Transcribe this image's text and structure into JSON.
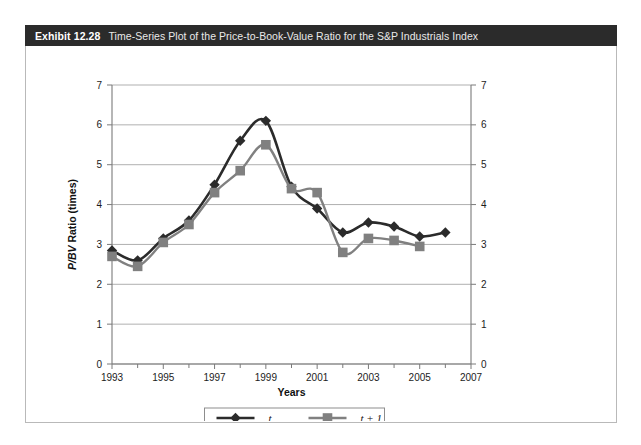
{
  "exhibit": {
    "number": "Exhibit 12.28",
    "title": "Time-Series Plot of the Price-to-Book-Value Ratio for the S&P Industrials Index"
  },
  "colors": {
    "header_bg": "#2b2b2b",
    "series_t": "#2b2b2b",
    "series_t1": "#808080",
    "grid": "#8c8c8c",
    "axis": "#7a7a7a",
    "panel_border": "#b9b9b9"
  },
  "chart_data": {
    "type": "line",
    "title": "Time-Series Plot of the Price-to-Book-Value Ratio for the S&P Industrials Index",
    "xlabel": "Years",
    "ylabel": "P/BV Ratio (times)",
    "ylabel_italic_part": "P/BV",
    "ylabel_plain_part": " Ratio (times)",
    "xlim": [
      1993,
      2007
    ],
    "ylim": [
      0,
      7
    ],
    "yticks": [
      0,
      1,
      2,
      3,
      4,
      5,
      6,
      7
    ],
    "ytick_labels": [
      "0",
      "1",
      "2",
      "3",
      "4",
      "5",
      "6",
      "7"
    ],
    "xticks": [
      1993,
      1995,
      1997,
      1999,
      2001,
      2003,
      2005,
      2007
    ],
    "xtick_labels": [
      "1993",
      "1995",
      "1997",
      "1999",
      "2001",
      "2003",
      "2005",
      "2007"
    ],
    "x_minor_ticks": [
      1994,
      1996,
      1998,
      2000,
      2002,
      2004,
      2006
    ],
    "grid": true,
    "grid_axis": "y",
    "dual_y_axis": true,
    "legend_position": "bottom-center",
    "series": [
      {
        "name": "t",
        "color": "#2b2b2b",
        "marker": "diamond",
        "x": [
          1993,
          1994,
          1995,
          1996,
          1997,
          1998,
          1999,
          2000,
          2001,
          2002,
          2003,
          2004,
          2005,
          2006
        ],
        "values": [
          2.85,
          2.6,
          3.15,
          3.6,
          4.5,
          5.6,
          6.1,
          4.45,
          3.9,
          3.3,
          3.55,
          3.45,
          3.2,
          3.3
        ]
      },
      {
        "name": "t + 1",
        "color": "#808080",
        "marker": "square",
        "x": [
          1993,
          1994,
          1995,
          1996,
          1997,
          1998,
          1999,
          2000,
          2001,
          2002,
          2003,
          2004,
          2005
        ],
        "values": [
          2.7,
          2.45,
          3.05,
          3.5,
          4.3,
          4.85,
          5.5,
          4.4,
          4.3,
          2.8,
          3.15,
          3.1,
          2.95
        ]
      }
    ],
    "legend": [
      {
        "label": "t",
        "color": "#2b2b2b",
        "marker": "diamond"
      },
      {
        "label": "t + 1",
        "color": "#808080",
        "marker": "square"
      }
    ]
  }
}
